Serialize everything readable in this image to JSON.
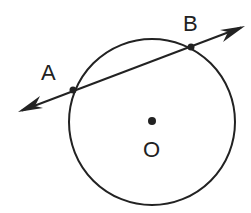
{
  "diagram": {
    "type": "geometry",
    "circle": {
      "center_label": "O",
      "cx": 152,
      "cy": 122,
      "r": 83
    },
    "line": {
      "x1": 18,
      "y1": 112,
      "x2": 245,
      "y2": 26,
      "arrows": "both"
    },
    "points": [
      {
        "label": "A",
        "x": 73,
        "y": 90
      },
      {
        "label": "B",
        "x": 191,
        "y": 47
      },
      {
        "label": "O",
        "x": 152,
        "y": 121
      }
    ],
    "labels": {
      "A": "A",
      "B": "B",
      "O": "O"
    },
    "stroke_color": "#222222"
  }
}
